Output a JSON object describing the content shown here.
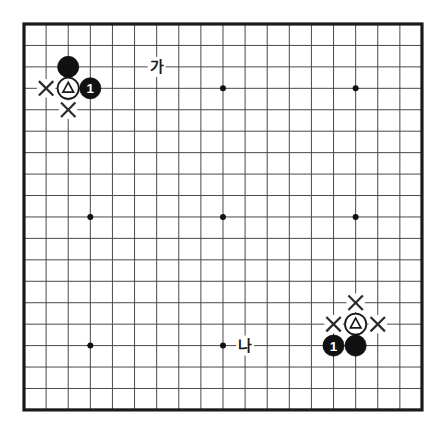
{
  "diagram": {
    "type": "go-board-diagram",
    "board_size": 19,
    "background_color": "#ffffff",
    "grid_color": "#4a4a4a",
    "border_color": "#1a1a1a",
    "geometry": {
      "left": 24,
      "top": 24,
      "right": 422,
      "bottom": 410,
      "step_x": 22.11,
      "step_y": 21.44,
      "stone_radius": 10.6
    },
    "star_points": [
      {
        "col": 4,
        "row": 4
      },
      {
        "col": 10,
        "row": 4
      },
      {
        "col": 16,
        "row": 4
      },
      {
        "col": 4,
        "row": 10
      },
      {
        "col": 10,
        "row": 10
      },
      {
        "col": 16,
        "row": 10
      },
      {
        "col": 4,
        "row": 16
      },
      {
        "col": 10,
        "row": 16
      },
      {
        "col": 16,
        "row": 16
      }
    ],
    "stones": [
      {
        "id": "tl-black-upper",
        "col": 3,
        "row": 3,
        "color": "black",
        "marker": "none",
        "number": ""
      },
      {
        "id": "tl-white-triangle",
        "col": 3,
        "row": 4,
        "color": "white",
        "marker": "triangle",
        "number": ""
      },
      {
        "id": "tl-black-one",
        "col": 4,
        "row": 4,
        "color": "black",
        "marker": "number",
        "number": "1"
      },
      {
        "id": "br-white-triangle",
        "col": 16,
        "row": 15,
        "color": "white",
        "marker": "triangle",
        "number": ""
      },
      {
        "id": "br-black-one",
        "col": 15,
        "row": 16,
        "color": "black",
        "marker": "number",
        "number": "1"
      },
      {
        "id": "br-black-plain",
        "col": 16,
        "row": 16,
        "color": "black",
        "marker": "none",
        "number": ""
      }
    ],
    "x_marks": [
      {
        "id": "tl-x-left",
        "col": 2,
        "row": 4
      },
      {
        "id": "tl-x-below",
        "col": 3,
        "row": 5
      },
      {
        "id": "br-x-above",
        "col": 16,
        "row": 14
      },
      {
        "id": "br-x-left",
        "col": 15,
        "row": 15
      },
      {
        "id": "br-x-right",
        "col": 17,
        "row": 15
      }
    ],
    "labels": [
      {
        "id": "label-ga",
        "text": "가",
        "col": 7,
        "row": 3
      },
      {
        "id": "label-na",
        "text": "나",
        "col": 11,
        "row": 16
      }
    ]
  }
}
